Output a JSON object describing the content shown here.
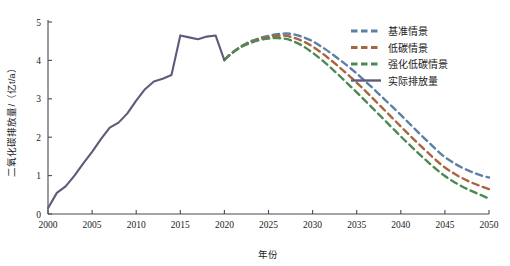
{
  "chart_data": {
    "type": "line",
    "title": "",
    "xlabel": "年份",
    "ylabel": "二氧化碳排放量/（亿t/a）",
    "xlim": [
      2000,
      2050
    ],
    "ylim": [
      0,
      5
    ],
    "xticks": [
      2000,
      2005,
      2010,
      2015,
      2020,
      2025,
      2030,
      2035,
      2040,
      2045,
      2050
    ],
    "yticks": [
      0,
      1,
      2,
      3,
      4,
      5
    ],
    "grid": false,
    "legend_position": "top-right",
    "series": [
      {
        "name": "基准情景",
        "key": "baseline",
        "color": "#5b7fa6",
        "style": "dashed",
        "x": [
          2020,
          2021,
          2022,
          2023,
          2024,
          2025,
          2026,
          2027,
          2028,
          2029,
          2030,
          2031,
          2032,
          2033,
          2034,
          2035,
          2036,
          2037,
          2038,
          2039,
          2040,
          2041,
          2042,
          2043,
          2044,
          2045,
          2046,
          2047,
          2048,
          2049,
          2050
        ],
        "values": [
          4.02,
          4.22,
          4.38,
          4.5,
          4.58,
          4.64,
          4.68,
          4.7,
          4.67,
          4.6,
          4.5,
          4.36,
          4.2,
          4.03,
          3.85,
          3.66,
          3.45,
          3.24,
          3.02,
          2.8,
          2.58,
          2.35,
          2.12,
          1.9,
          1.68,
          1.48,
          1.33,
          1.2,
          1.1,
          1.01,
          0.95
        ]
      },
      {
        "name": "低碳情景",
        "key": "low_carbon",
        "color": "#a9653f",
        "style": "dashed",
        "x": [
          2020,
          2021,
          2022,
          2023,
          2024,
          2025,
          2026,
          2027,
          2028,
          2029,
          2030,
          2031,
          2032,
          2033,
          2034,
          2035,
          2036,
          2037,
          2038,
          2039,
          2040,
          2041,
          2042,
          2043,
          2044,
          2045,
          2046,
          2047,
          2048,
          2049,
          2050
        ],
        "values": [
          4.02,
          4.22,
          4.37,
          4.48,
          4.56,
          4.61,
          4.64,
          4.64,
          4.58,
          4.49,
          4.36,
          4.2,
          4.02,
          3.83,
          3.63,
          3.42,
          3.2,
          2.97,
          2.74,
          2.51,
          2.28,
          2.05,
          1.83,
          1.61,
          1.4,
          1.21,
          1.06,
          0.93,
          0.82,
          0.73,
          0.65
        ]
      },
      {
        "name": "强化低碳情景",
        "key": "enhanced_low_carbon",
        "color": "#4b8a52",
        "style": "dashed",
        "x": [
          2020,
          2021,
          2022,
          2023,
          2024,
          2025,
          2026,
          2027,
          2028,
          2029,
          2030,
          2031,
          2032,
          2033,
          2034,
          2035,
          2036,
          2037,
          2038,
          2039,
          2040,
          2041,
          2042,
          2043,
          2044,
          2045,
          2046,
          2047,
          2048,
          2049,
          2050
        ],
        "values": [
          4.02,
          4.21,
          4.36,
          4.46,
          4.53,
          4.57,
          4.58,
          4.56,
          4.48,
          4.36,
          4.2,
          4.02,
          3.82,
          3.61,
          3.39,
          3.17,
          2.94,
          2.71,
          2.48,
          2.25,
          2.02,
          1.8,
          1.58,
          1.37,
          1.17,
          0.99,
          0.84,
          0.71,
          0.6,
          0.5,
          0.4
        ]
      },
      {
        "name": "实际排放量",
        "key": "actual_emissions",
        "color": "#5c5c7a",
        "style": "solid",
        "x": [
          2000,
          2001,
          2002,
          2003,
          2004,
          2005,
          2006,
          2007,
          2008,
          2009,
          2010,
          2011,
          2012,
          2013,
          2014,
          2015,
          2016,
          2017,
          2018,
          2019,
          2020
        ],
        "values": [
          0.15,
          0.55,
          0.72,
          1.0,
          1.32,
          1.62,
          1.95,
          2.25,
          2.38,
          2.62,
          2.95,
          3.25,
          3.45,
          3.52,
          3.62,
          4.65,
          4.6,
          4.55,
          4.62,
          4.65,
          4.0
        ]
      }
    ]
  },
  "legend": {
    "items": [
      {
        "label": "基准情景",
        "color": "#5b7fa6",
        "style": "dashed"
      },
      {
        "label": "低碳情景",
        "color": "#a9653f",
        "style": "dashed"
      },
      {
        "label": "强化低碳情景",
        "color": "#4b8a52",
        "style": "dashed"
      },
      {
        "label": "实际排放量",
        "color": "#5c5c7a",
        "style": "solid"
      }
    ]
  },
  "axes": {
    "x_title": "年份",
    "y_title": "二氧化碳排放量/（亿t/a）",
    "x_tick_labels": [
      "2000",
      "2005",
      "2010",
      "2015",
      "2020",
      "2025",
      "2030",
      "2035",
      "2040",
      "2045",
      "2050"
    ],
    "y_tick_labels": [
      "0",
      "1",
      "2",
      "3",
      "4",
      "5"
    ]
  }
}
